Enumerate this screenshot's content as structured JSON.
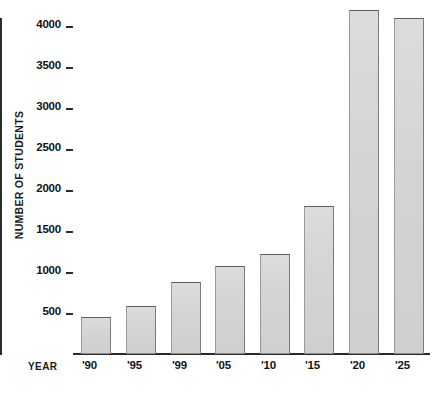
{
  "chart_data": {
    "type": "bar",
    "title": "",
    "xlabel": "YEAR",
    "ylabel": "NUMBER OF STUDENTS",
    "categories": [
      "'90",
      "'95",
      "'99",
      "'05",
      "'10",
      "'15",
      "'20",
      "'25"
    ],
    "values": [
      450,
      580,
      880,
      1070,
      1220,
      1800,
      4200,
      4100
    ],
    "ylim": [
      0,
      4300
    ],
    "yticks": [
      500,
      1000,
      1500,
      2000,
      2500,
      3000,
      3500,
      4000
    ],
    "ytick_labels": [
      "500",
      "1000",
      "1500",
      "2000",
      "2500",
      "3000",
      "3500",
      "4000"
    ],
    "grid": false,
    "legend": false,
    "bar_fill_color": "#d4d4d4",
    "bar_edge_color": "#7a7a7a",
    "axis_color": "#2b2b2b",
    "background_color": "#ffffff"
  }
}
